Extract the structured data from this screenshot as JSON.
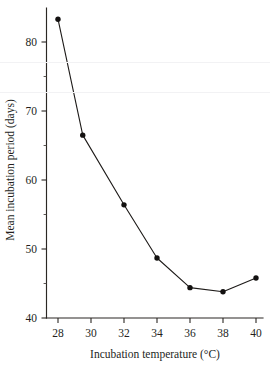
{
  "chart_data": {
    "type": "line",
    "title": "",
    "xlabel": "Incubation temperature (°C)",
    "ylabel": "Mean incubation period (days)",
    "x": [
      28,
      29.5,
      32,
      34,
      36,
      38,
      40
    ],
    "values": [
      83.3,
      66.5,
      56.4,
      48.7,
      44.4,
      43.8,
      45.8
    ],
    "series": [
      {
        "name": "Mean incubation period",
        "values": [
          83.3,
          66.5,
          56.4,
          48.7,
          44.4,
          43.8,
          45.8
        ]
      }
    ],
    "xlim": [
      27.2,
      40.4
    ],
    "ylim": [
      40,
      84.5
    ],
    "xticks": [
      28,
      30,
      32,
      34,
      36,
      38,
      40
    ],
    "xticklabels": [
      "28",
      "30",
      "32",
      "34",
      "36",
      "38",
      "40"
    ],
    "yticks": [
      40,
      50,
      60,
      70,
      80
    ],
    "yticklabels": [
      "40",
      "50",
      "60",
      "70",
      "80"
    ],
    "yminorticks": [
      45,
      55,
      65,
      75
    ],
    "grid": false,
    "legend": false,
    "marker": "filled-circle",
    "line_color": "#1d1a18",
    "marker_color": "#131110"
  },
  "axes": {
    "x_title": "Incubation temperature (°C)",
    "y_title": "Mean incubation period (days)",
    "x_tick_labels": [
      "28",
      "30",
      "32",
      "34",
      "36",
      "38",
      "40"
    ],
    "y_tick_labels": [
      "80",
      "70",
      "60",
      "50",
      "40"
    ]
  }
}
